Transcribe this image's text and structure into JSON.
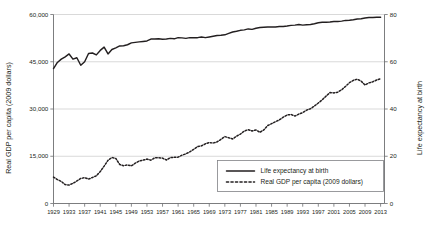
{
  "chart_data": {
    "type": "line",
    "title": "",
    "xlabel": "",
    "ylabel": "Real GDP per capita (2009 dollars)",
    "y2label": "Life expectancy at birth",
    "grid": true,
    "legend_position": "bottom-right",
    "xlim": [
      1929,
      2014
    ],
    "ylim": [
      0,
      60000
    ],
    "y2lim": [
      0,
      80
    ],
    "ytick_labels": [
      "60,000",
      "45,000",
      "30,000",
      "15,000",
      "0"
    ],
    "ytick_values": [
      60000,
      45000,
      30000,
      15000,
      0
    ],
    "y2tick_labels": [
      "80",
      "60",
      "40",
      "20",
      "0"
    ],
    "y2tick_values": [
      80,
      60,
      40,
      20,
      0
    ],
    "xtick_labels": [
      "1929",
      "1933",
      "1937",
      "1941",
      "1945",
      "1949",
      "1953",
      "1957",
      "1961",
      "1965",
      "1969",
      "1973",
      "1977",
      "1981",
      "1985",
      "1989",
      "1993",
      "1997",
      "2001",
      "2005",
      "2009",
      "2013"
    ],
    "xtick_values": [
      1929,
      1933,
      1937,
      1941,
      1945,
      1949,
      1953,
      1957,
      1961,
      1965,
      1969,
      1973,
      1977,
      1981,
      1985,
      1989,
      1993,
      1997,
      2001,
      2005,
      2009,
      2013
    ],
    "series": [
      {
        "name": "Life expectancy at birth",
        "axis": "right",
        "style": "solid",
        "color": "#231f20",
        "x": [
          1929,
          1930,
          1931,
          1932,
          1933,
          1934,
          1935,
          1936,
          1937,
          1938,
          1939,
          1940,
          1941,
          1942,
          1943,
          1944,
          1945,
          1946,
          1947,
          1948,
          1949,
          1950,
          1951,
          1952,
          1953,
          1954,
          1955,
          1956,
          1957,
          1958,
          1959,
          1960,
          1961,
          1962,
          1963,
          1964,
          1965,
          1966,
          1967,
          1968,
          1969,
          1970,
          1971,
          1972,
          1973,
          1974,
          1975,
          1976,
          1977,
          1978,
          1979,
          1980,
          1981,
          1982,
          1983,
          1984,
          1985,
          1986,
          1987,
          1988,
          1989,
          1990,
          1991,
          1992,
          1993,
          1994,
          1995,
          1996,
          1997,
          1998,
          1999,
          2000,
          2001,
          2002,
          2003,
          2004,
          2005,
          2006,
          2007,
          2008,
          2009,
          2010,
          2011,
          2012,
          2013
        ],
        "values": [
          57.1,
          59.7,
          61.1,
          62.1,
          63.3,
          61.1,
          61.7,
          58.5,
          60.0,
          63.5,
          63.7,
          62.9,
          64.8,
          66.2,
          63.3,
          65.2,
          65.9,
          66.7,
          66.8,
          67.2,
          68.0,
          68.2,
          68.4,
          68.6,
          68.8,
          69.6,
          69.6,
          69.7,
          69.5,
          69.6,
          69.9,
          69.7,
          70.2,
          70.1,
          69.9,
          70.2,
          70.2,
          70.2,
          70.5,
          70.2,
          70.5,
          70.8,
          71.1,
          71.2,
          71.4,
          72.0,
          72.6,
          72.9,
          73.3,
          73.5,
          73.9,
          73.7,
          74.2,
          74.5,
          74.6,
          74.7,
          74.7,
          74.7,
          74.9,
          74.9,
          75.1,
          75.4,
          75.5,
          75.8,
          75.5,
          75.7,
          75.8,
          76.1,
          76.5,
          76.7,
          76.7,
          76.8,
          77.0,
          77.0,
          77.2,
          77.5,
          77.6,
          77.8,
          78.1,
          78.2,
          78.5,
          78.7,
          78.7,
          78.8,
          78.8
        ]
      },
      {
        "name": "Real GDP per capita (2009 dollars)",
        "axis": "left",
        "style": "dotted",
        "color": "#231f20",
        "x": [
          1929,
          1930,
          1931,
          1932,
          1933,
          1934,
          1935,
          1936,
          1937,
          1938,
          1939,
          1940,
          1941,
          1942,
          1943,
          1944,
          1945,
          1946,
          1947,
          1948,
          1949,
          1950,
          1951,
          1952,
          1953,
          1954,
          1955,
          1956,
          1957,
          1958,
          1959,
          1960,
          1961,
          1962,
          1963,
          1964,
          1965,
          1966,
          1967,
          1968,
          1969,
          1970,
          1971,
          1972,
          1973,
          1974,
          1975,
          1976,
          1977,
          1978,
          1979,
          1980,
          1981,
          1982,
          1983,
          1984,
          1985,
          1986,
          1987,
          1988,
          1989,
          1990,
          1991,
          1992,
          1993,
          1994,
          1995,
          1996,
          1997,
          1998,
          1999,
          2000,
          2001,
          2002,
          2003,
          2004,
          2005,
          2006,
          2007,
          2008,
          2009,
          2010,
          2011,
          2012,
          2013
        ],
        "values": [
          8400,
          7600,
          7000,
          6000,
          5850,
          6400,
          7150,
          7950,
          8200,
          7750,
          8250,
          8800,
          10150,
          11850,
          13700,
          14600,
          14300,
          12400,
          12000,
          12250,
          11950,
          12800,
          13500,
          13750,
          14100,
          13750,
          14500,
          14500,
          14400,
          13800,
          14550,
          14650,
          14700,
          15350,
          15750,
          16400,
          17200,
          18050,
          18300,
          18950,
          19350,
          19200,
          19550,
          20350,
          21250,
          20850,
          20500,
          21350,
          22050,
          23000,
          23450,
          23000,
          23350,
          22600,
          23350,
          24750,
          25350,
          25950,
          26550,
          27400,
          28100,
          28250,
          27750,
          28400,
          28850,
          29650,
          30100,
          30950,
          31900,
          32900,
          34100,
          35200,
          35100,
          35350,
          36100,
          37200,
          38350,
          39100,
          39450,
          38850,
          37600,
          38300,
          38650,
          39200,
          39600
        ]
      }
    ]
  },
  "axes": {
    "left_title": "Real GDP per capita (2009 dollars)",
    "right_title": "Life expectancy at birth"
  },
  "legend": {
    "items": [
      {
        "label": "Life expectancy at birth",
        "style": "solid"
      },
      {
        "label": "Real GDP per capita (2009 dollars)",
        "style": "dotted"
      }
    ]
  },
  "colors": {
    "line": "#231f20",
    "grid": "#c9c9c9",
    "axis": "#6d6e71",
    "text": "#231f20",
    "legend_border": "#808285"
  }
}
